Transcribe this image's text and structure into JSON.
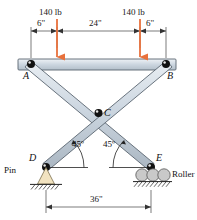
{
  "figure": {
    "colors": {
      "member_fill": "#ccd6e0",
      "member_fill_light": "#e8edf2",
      "member_stroke": "#5a6570",
      "load_arrow": "#e8713c",
      "pin_support_fill": "#f2e3c0",
      "roller_fill": "#c9c9c9",
      "dimension_line": "#444444",
      "text": "#111111"
    },
    "loads": [
      {
        "label": "140 lb",
        "value": 140,
        "unit": "lb",
        "direction": "down",
        "at": "left"
      },
      {
        "label": "140 lb",
        "value": 140,
        "unit": "lb",
        "direction": "down",
        "at": "right"
      }
    ],
    "top_dimensions": [
      {
        "label": "6\"",
        "value": 6,
        "unit": "in"
      },
      {
        "label": "24\"",
        "value": 24,
        "unit": "in"
      },
      {
        "label": "6\"",
        "value": 6,
        "unit": "in"
      }
    ],
    "bottom_dimension": {
      "label": "36\"",
      "value": 36,
      "unit": "in"
    },
    "angles": [
      {
        "label": "45º",
        "value": 45,
        "unit": "deg",
        "at": "D"
      },
      {
        "label": "45º",
        "value": 45,
        "unit": "deg",
        "at": "E"
      }
    ],
    "joints": [
      {
        "id": "A",
        "label": "A",
        "type": "pin-joint"
      },
      {
        "id": "B",
        "label": "B",
        "type": "pin-joint"
      },
      {
        "id": "C",
        "label": "C",
        "type": "pin-joint"
      },
      {
        "id": "D",
        "label": "D",
        "type": "support"
      },
      {
        "id": "E",
        "label": "E",
        "type": "support"
      }
    ],
    "supports": [
      {
        "id": "D",
        "label": "Pin",
        "kind": "pin"
      },
      {
        "id": "E",
        "label": "Roller",
        "kind": "roller"
      }
    ]
  }
}
